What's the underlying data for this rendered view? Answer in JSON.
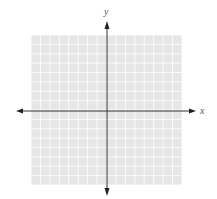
{
  "diagram": {
    "type": "coordinate-plane",
    "axes": {
      "x_label": "x",
      "y_label": "y"
    },
    "grid": {
      "columns": 16,
      "rows": 16,
      "origin_col": 8,
      "origin_row": 8,
      "background_color": "#e6e6e6",
      "line_color": "#ffffff"
    },
    "colors": {
      "axis": "#333333",
      "label": "#555555"
    }
  }
}
